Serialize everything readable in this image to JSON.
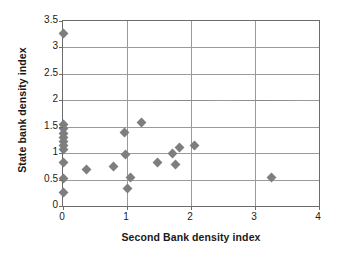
{
  "chart_data": {
    "type": "scatter",
    "title": "",
    "xlabel": "Second Bank density index",
    "ylabel": "State bank density index",
    "xlim": [
      0,
      4
    ],
    "ylim": [
      0,
      3.5
    ],
    "xticks": [
      "0",
      "1",
      "2",
      "3",
      "4"
    ],
    "xtick_values": [
      0,
      1,
      2,
      3,
      4
    ],
    "yticks": [
      "0",
      "0.5",
      "1",
      "1.5",
      "2",
      "2.5",
      "3",
      "3.5"
    ],
    "ytick_values": [
      0,
      0.5,
      1,
      1.5,
      2,
      2.5,
      3,
      3.5
    ],
    "grid": true,
    "grid_axis": "both",
    "legend": false,
    "marker": "diamond",
    "marker_color": "#7e7e7e",
    "points": [
      {
        "x": 0.0,
        "y": 3.27
      },
      {
        "x": 0.0,
        "y": 1.55
      },
      {
        "x": 0.0,
        "y": 1.46
      },
      {
        "x": 0.0,
        "y": 1.38
      },
      {
        "x": 0.0,
        "y": 1.3
      },
      {
        "x": 0.0,
        "y": 1.22
      },
      {
        "x": 0.0,
        "y": 1.14
      },
      {
        "x": 0.0,
        "y": 1.06
      },
      {
        "x": 0.0,
        "y": 0.83
      },
      {
        "x": 0.0,
        "y": 0.52
      },
      {
        "x": 0.0,
        "y": 0.25
      },
      {
        "x": 0.36,
        "y": 0.69
      },
      {
        "x": 0.79,
        "y": 0.75
      },
      {
        "x": 0.96,
        "y": 1.4
      },
      {
        "x": 0.97,
        "y": 0.98
      },
      {
        "x": 1.0,
        "y": 0.33
      },
      {
        "x": 1.06,
        "y": 0.54
      },
      {
        "x": 1.23,
        "y": 1.58
      },
      {
        "x": 1.48,
        "y": 0.82
      },
      {
        "x": 1.71,
        "y": 1.0
      },
      {
        "x": 1.76,
        "y": 0.79
      },
      {
        "x": 1.82,
        "y": 1.11
      },
      {
        "x": 2.05,
        "y": 1.14
      },
      {
        "x": 3.25,
        "y": 0.54
      }
    ]
  },
  "axes": {
    "frame_color": "#6b6b6b",
    "gridline_color": "#9a9a9a"
  }
}
